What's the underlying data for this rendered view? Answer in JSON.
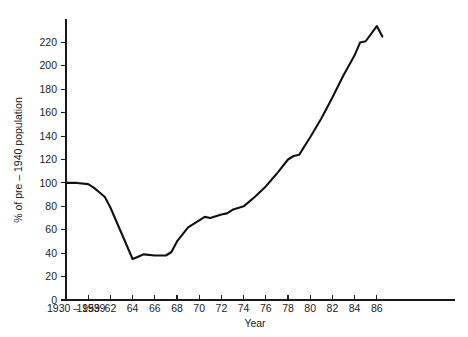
{
  "chart_data": {
    "type": "line",
    "title": "",
    "xlabel": "Year",
    "ylabel": "% of pre – 1940 population",
    "xlim": [
      0,
      17.6
    ],
    "ylim": [
      0,
      240
    ],
    "grid": false,
    "legend": null,
    "x_tick_labels": [
      "1930 – 1939",
      "1959",
      "62",
      "64",
      "66",
      "68",
      "70",
      "72",
      "74",
      "76",
      "78",
      "80",
      "82",
      "84",
      "86"
    ],
    "x_tick_positions": [
      0,
      1,
      2,
      3,
      4,
      5,
      6,
      7,
      8,
      9,
      10,
      11,
      12,
      13,
      14
    ],
    "y_tick_labels": [
      "0",
      "20",
      "40",
      "60",
      "80",
      "100",
      "120",
      "140",
      "160",
      "180",
      "200",
      "220"
    ],
    "y_tick_values": [
      0,
      20,
      40,
      60,
      80,
      100,
      120,
      140,
      160,
      180,
      200,
      220
    ],
    "series": [
      {
        "name": "population index",
        "x": [
          0.0,
          0.5,
          1.0,
          1.25,
          1.5,
          1.75,
          2.0,
          2.5,
          3.0,
          3.25,
          3.5,
          4.0,
          4.25,
          4.5,
          4.75,
          5.0,
          5.5,
          6.0,
          6.25,
          6.5,
          7.0,
          7.25,
          7.5,
          8.0,
          8.5,
          9.0,
          9.5,
          10.0,
          10.25,
          10.5,
          11.0,
          11.5,
          12.0,
          12.5,
          13.0,
          13.25,
          13.5,
          14.0,
          14.25
        ],
        "y": [
          100,
          100,
          99,
          96,
          92,
          88,
          79,
          57,
          35,
          37,
          39,
          38,
          38,
          38,
          41,
          50,
          62,
          68,
          71,
          70,
          73,
          74,
          77,
          80,
          88,
          97,
          108,
          120,
          123,
          124,
          139,
          155,
          173,
          192,
          209,
          220,
          221,
          234,
          225
        ],
        "color": "#111111",
        "linewidth": 2.1
      }
    ]
  },
  "axis_geometry": {
    "plot_left": 66,
    "plot_right": 455,
    "plot_bottom": 300,
    "plot_top": 19,
    "x_step_px": 22.2,
    "y_unit_px": 1.164
  }
}
